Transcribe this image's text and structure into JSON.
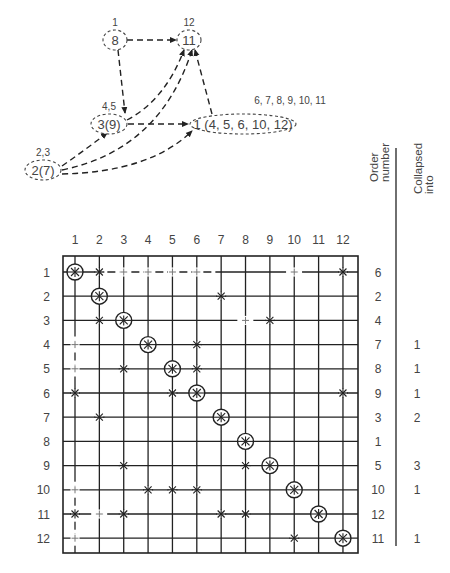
{
  "graph": {
    "nodes": [
      {
        "id": "n8",
        "label": "8",
        "above": "1",
        "cx": 115,
        "cy": 40,
        "rx": 12,
        "ry": 10
      },
      {
        "id": "n11",
        "label": "11",
        "above": "12",
        "cx": 189,
        "cy": 40,
        "rx": 12,
        "ry": 10
      },
      {
        "id": "n3",
        "label": "3(9)",
        "above": "4,5",
        "cx": 109,
        "cy": 124,
        "rx": 18,
        "ry": 10
      },
      {
        "id": "n1",
        "label": "1 (4, 5, 6, 10, 12)",
        "above": "6, 7, 8, 9, 10, 11",
        "cx": 243,
        "cy": 124,
        "rx": 53,
        "ry": 10
      },
      {
        "id": "n2",
        "label": "2(7)",
        "above": "2,3",
        "cx": 43,
        "cy": 170,
        "rx": 18,
        "ry": 10
      }
    ],
    "edges": [
      {
        "from": "n8",
        "to": "n11",
        "path": "M127,40 L176,40"
      },
      {
        "from": "n8",
        "to": "n3",
        "path": "M118,50 L125,113"
      },
      {
        "from": "n3",
        "to": "n11",
        "path": "M127,120 Q165,100 184,50"
      },
      {
        "from": "n3",
        "to": "n1",
        "path": "M128,124 L188,124"
      },
      {
        "from": "n1",
        "to": "n11",
        "path": "M212,114 L195,50"
      },
      {
        "from": "n2",
        "to": "n3",
        "path": "M62,166 Q85,150 107,133"
      },
      {
        "from": "n2",
        "to": "n11",
        "path": "M62,170 Q160,150 192,50"
      },
      {
        "from": "n2",
        "to": "n1",
        "path": "M62,174 Q150,172 192,131"
      }
    ]
  },
  "matrix": {
    "column_labels": [
      "1",
      "2",
      "3",
      "4",
      "5",
      "6",
      "7",
      "8",
      "9",
      "10",
      "11",
      "12"
    ],
    "row_labels": [
      "1",
      "2",
      "3",
      "4",
      "5",
      "6",
      "7",
      "8",
      "9",
      "10",
      "11",
      "12"
    ],
    "legend": {
      "nonzero": "x-mark",
      "pivot": "circled-x-mark",
      "fill_in": "plus-mark"
    },
    "entries": [
      {
        "r": 1,
        "c": 1,
        "t": "pivot"
      },
      {
        "r": 1,
        "c": 2,
        "t": "x"
      },
      {
        "r": 1,
        "c": 3,
        "t": "fill"
      },
      {
        "r": 1,
        "c": 4,
        "t": "fill"
      },
      {
        "r": 1,
        "c": 5,
        "t": "fill"
      },
      {
        "r": 1,
        "c": 6,
        "t": "fill"
      },
      {
        "r": 1,
        "c": 10,
        "t": "fill"
      },
      {
        "r": 1,
        "c": 12,
        "t": "x"
      },
      {
        "r": 2,
        "c": 2,
        "t": "pivot"
      },
      {
        "r": 2,
        "c": 7,
        "t": "x"
      },
      {
        "r": 3,
        "c": 2,
        "t": "x"
      },
      {
        "r": 3,
        "c": 3,
        "t": "pivot"
      },
      {
        "r": 3,
        "c": 8,
        "t": "fill"
      },
      {
        "r": 3,
        "c": 9,
        "t": "x"
      },
      {
        "r": 4,
        "c": 1,
        "t": "fill"
      },
      {
        "r": 4,
        "c": 4,
        "t": "pivot"
      },
      {
        "r": 4,
        "c": 6,
        "t": "x"
      },
      {
        "r": 5,
        "c": 1,
        "t": "fill"
      },
      {
        "r": 5,
        "c": 3,
        "t": "x"
      },
      {
        "r": 5,
        "c": 5,
        "t": "pivot"
      },
      {
        "r": 5,
        "c": 6,
        "t": "x"
      },
      {
        "r": 6,
        "c": 1,
        "t": "x"
      },
      {
        "r": 6,
        "c": 5,
        "t": "x"
      },
      {
        "r": 6,
        "c": 6,
        "t": "pivot"
      },
      {
        "r": 6,
        "c": 12,
        "t": "x"
      },
      {
        "r": 7,
        "c": 2,
        "t": "x"
      },
      {
        "r": 7,
        "c": 7,
        "t": "pivot"
      },
      {
        "r": 8,
        "c": 8,
        "t": "pivot"
      },
      {
        "r": 9,
        "c": 3,
        "t": "x"
      },
      {
        "r": 9,
        "c": 8,
        "t": "x"
      },
      {
        "r": 9,
        "c": 9,
        "t": "pivot"
      },
      {
        "r": 10,
        "c": 1,
        "t": "fill"
      },
      {
        "r": 10,
        "c": 4,
        "t": "x"
      },
      {
        "r": 10,
        "c": 5,
        "t": "x"
      },
      {
        "r": 10,
        "c": 6,
        "t": "x"
      },
      {
        "r": 10,
        "c": 10,
        "t": "pivot"
      },
      {
        "r": 11,
        "c": 1,
        "t": "x"
      },
      {
        "r": 11,
        "c": 2,
        "t": "fill"
      },
      {
        "r": 11,
        "c": 3,
        "t": "x"
      },
      {
        "r": 11,
        "c": 7,
        "t": "x"
      },
      {
        "r": 11,
        "c": 8,
        "t": "x"
      },
      {
        "r": 11,
        "c": 11,
        "t": "pivot"
      },
      {
        "r": 12,
        "c": 1,
        "t": "fill"
      },
      {
        "r": 12,
        "c": 10,
        "t": "x"
      },
      {
        "r": 12,
        "c": 12,
        "t": "pivot"
      }
    ],
    "dashed_segments": [
      {
        "orient": "h",
        "row": 1,
        "from_col": 2,
        "to_col": 7
      },
      {
        "orient": "h",
        "row": 1,
        "from_col": 9.5,
        "to_col": 10.5
      },
      {
        "orient": "h",
        "row": 3,
        "from_col": 7.5,
        "to_col": 8.5
      },
      {
        "orient": "v",
        "col": 1,
        "from_row": 3.5,
        "to_row": 5.5
      },
      {
        "orient": "v",
        "col": 1,
        "from_row": 9.5,
        "to_row": 12.5
      },
      {
        "orient": "h",
        "row": 11,
        "from_col": 1.5,
        "to_col": 2.5
      }
    ]
  },
  "side_table": {
    "headers": {
      "order": "Order number",
      "collapsed": "Collapsed into"
    },
    "order_number": [
      "6",
      "2",
      "4",
      "7",
      "8",
      "9",
      "3",
      "1",
      "5",
      "10",
      "12",
      "11"
    ],
    "collapsed_into": [
      "",
      "",
      "",
      "1",
      "1",
      "1",
      "2",
      "",
      "3",
      "1",
      "",
      "1"
    ]
  }
}
